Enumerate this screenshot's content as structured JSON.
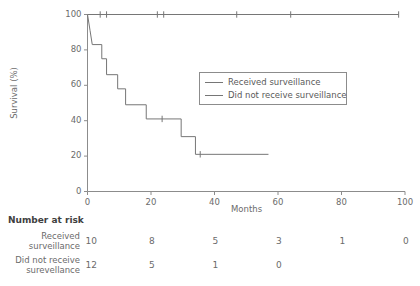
{
  "chart_data": {
    "type": "line",
    "title": "",
    "xlabel": "Months",
    "ylabel": "Survival (%)",
    "xlim": [
      0,
      100
    ],
    "ylim": [
      0,
      100
    ],
    "xticks": [
      0,
      20,
      40,
      60,
      80,
      100
    ],
    "yticks": [
      0,
      20,
      40,
      60,
      80,
      100
    ],
    "xtick_labels": [
      "0",
      "20",
      "40",
      "60",
      "80",
      "100"
    ],
    "ytick_labels": [
      "0",
      "20",
      "40",
      "60",
      "80",
      "100"
    ],
    "grid": false,
    "legend_position": "upper-center-right",
    "series": [
      {
        "name": "Received surveillance",
        "color": "#767676",
        "step_points": [
          {
            "x": 0,
            "y": 100
          },
          {
            "x": 98,
            "y": 100
          }
        ],
        "censor_marks": [
          {
            "x": 4,
            "y": 100
          },
          {
            "x": 6,
            "y": 100
          },
          {
            "x": 22,
            "y": 100
          },
          {
            "x": 24,
            "y": 100
          },
          {
            "x": 47,
            "y": 100
          },
          {
            "x": 64,
            "y": 100
          },
          {
            "x": 98,
            "y": 100
          }
        ]
      },
      {
        "name": "Did not receive surveillance",
        "color": "#767676",
        "step_points": [
          {
            "x": 0,
            "y": 100
          },
          {
            "x": 0.8,
            "y": 91
          },
          {
            "x": 1.5,
            "y": 83
          },
          {
            "x": 4.5,
            "y": 83
          },
          {
            "x": 4.5,
            "y": 75
          },
          {
            "x": 6.0,
            "y": 75
          },
          {
            "x": 6.0,
            "y": 66
          },
          {
            "x": 9.5,
            "y": 66
          },
          {
            "x": 9.5,
            "y": 58
          },
          {
            "x": 12.0,
            "y": 58
          },
          {
            "x": 12.0,
            "y": 49
          },
          {
            "x": 18.5,
            "y": 49
          },
          {
            "x": 18.5,
            "y": 41
          },
          {
            "x": 29.5,
            "y": 41
          },
          {
            "x": 29.5,
            "y": 31
          },
          {
            "x": 34.0,
            "y": 31
          },
          {
            "x": 34.0,
            "y": 21
          },
          {
            "x": 57.0,
            "y": 21
          }
        ],
        "censor_marks": [
          {
            "x": 23.5,
            "y": 41
          },
          {
            "x": 35.5,
            "y": 21
          }
        ]
      }
    ]
  },
  "risk_table": {
    "title": "Number at risk",
    "time_points": [
      0,
      20,
      40,
      60,
      80,
      100
    ],
    "rows": [
      {
        "label_line1": "Received",
        "label_line2": "surveillance",
        "values": [
          "10",
          "8",
          "5",
          "3",
          "1",
          "0"
        ]
      },
      {
        "label_line1": "Did not receive",
        "label_line2": "surevellance",
        "values": [
          "12",
          "5",
          "1",
          "0"
        ]
      }
    ]
  },
  "style": {
    "axis_color": "#8c8c8c",
    "line_color": "#767676",
    "text_color": "#6b6b6b",
    "background": "#ffffff"
  }
}
